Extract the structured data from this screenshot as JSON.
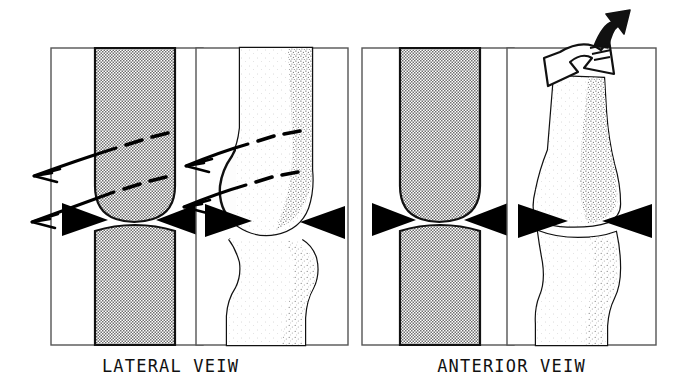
{
  "figure": {
    "background_color": "#ffffff",
    "ink_color": "#000000",
    "shade_color": "#c2c2c2",
    "stipple_color": "#9a9a9a",
    "frame_color": "#555555"
  },
  "panels": [
    {
      "id": "lateral",
      "caption": "LATERAL VEIW",
      "subpanels": [
        {
          "id": "lateral-limb",
          "content": "shaded-limb-silhouette",
          "description": "Halftone shaded leg silhouette in lateral profile with rounded distal femur and joint gap"
        },
        {
          "id": "lateral-bone",
          "content": "bone-outline-lateral",
          "description": "Lateral knee bone drawing: femur with rounded condyle above, tibia below, stippled shading"
        }
      ],
      "arrows": {
        "dashed_sweeps": [
          {
            "id": "lateral-sweep-upper-limb",
            "direction": "left",
            "style": "dashed-curved"
          },
          {
            "id": "lateral-sweep-lower-limb",
            "direction": "left",
            "style": "dashed-curved"
          },
          {
            "id": "lateral-sweep-upper-bone",
            "direction": "left",
            "style": "dashed-curved"
          },
          {
            "id": "lateral-sweep-lower-bone",
            "direction": "left",
            "style": "dashed-curved"
          }
        ],
        "joint_markers": [
          {
            "id": "lateral-limb-marker-left",
            "points": "right"
          },
          {
            "id": "lateral-limb-marker-right",
            "points": "left"
          },
          {
            "id": "lateral-bone-marker-left",
            "points": "right"
          },
          {
            "id": "lateral-bone-marker-right",
            "points": "left"
          }
        ]
      }
    },
    {
      "id": "anterior",
      "caption": "ANTERIOR VEIW",
      "subpanels": [
        {
          "id": "anterior-limb",
          "content": "shaded-limb-silhouette",
          "description": "Halftone shaded leg silhouette in anterior view with rounded joint gap"
        },
        {
          "id": "anterior-bone",
          "content": "bone-outline-anterior",
          "description": "Anterior knee bone drawing: femoral condyles above, tibial plateau below, stippled shading"
        }
      ],
      "arrows": {
        "rotation": [
          {
            "id": "anterior-rotation-hollow-arrow",
            "style": "hollow-outline-curved",
            "direction": "down-left"
          },
          {
            "id": "anterior-rotation-solid-arrow",
            "style": "solid-black-curved",
            "direction": "up-right"
          }
        ],
        "joint_markers": [
          {
            "id": "anterior-limb-marker-left",
            "points": "right"
          },
          {
            "id": "anterior-limb-marker-right",
            "points": "left"
          },
          {
            "id": "anterior-bone-marker-left",
            "points": "right"
          },
          {
            "id": "anterior-bone-marker-right",
            "points": "left"
          }
        ]
      }
    }
  ]
}
